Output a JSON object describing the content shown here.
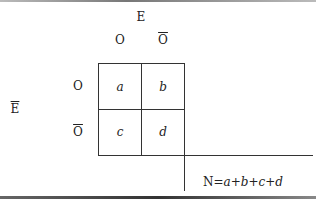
{
  "diagram": {
    "type": "2x2 contingency table",
    "column_group_label": "E",
    "column_headers": [
      "O",
      "Ō"
    ],
    "row_group_label": "Ē",
    "row_headers": [
      "O",
      "Ō"
    ],
    "cells": [
      [
        "a",
        "b"
      ],
      [
        "c",
        "d"
      ]
    ],
    "total_label": "N",
    "total_formula": {
      "lhs": "N",
      "eq": "=",
      "terms": [
        "a",
        "b",
        "c",
        "d"
      ],
      "op": "+"
    },
    "line_color": "#333333"
  }
}
